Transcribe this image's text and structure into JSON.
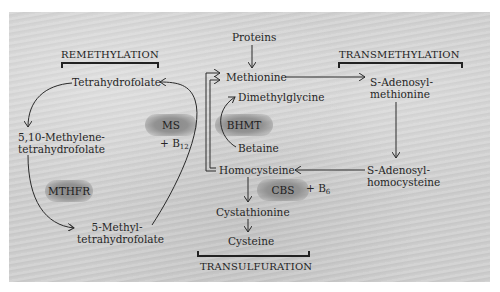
{
  "sections": {
    "remethylation": "REMETHYLATION",
    "transmethylation": "TRANSMETHYLATION",
    "transulfuration": "TRANSULFURATION"
  },
  "metabolites": {
    "proteins": "Proteins",
    "methionine": "Methionine",
    "dimethylglycine": "Dimethylglycine",
    "betaine": "Betaine",
    "homocysteine": "Homocysteine",
    "cystathionine": "Cystathionine",
    "cysteine": "Cysteine",
    "tetrahydrofolate": "Tetrahydrofolate",
    "methylene_thf_line1": "5,10-Methylene-",
    "methylene_thf_line2": "tetrahydrofolate",
    "methyl_thf_line1": "5-Methyl-",
    "methyl_thf_line2": "tetrahydrofolate",
    "sam_line1": "S-Adenosyl-",
    "sam_line2": "methionine",
    "sah_line1": "S-Adenosyl-",
    "sah_line2": "homocysteine"
  },
  "enzymes": {
    "ms": "MS",
    "bhmt": "BHMT",
    "mthfr": "MTHFR",
    "cbs": "CBS"
  },
  "cofactors": {
    "ms": {
      "prefix": "+ B",
      "sub": "12"
    },
    "cbs": {
      "prefix": "+ B",
      "sub": "6"
    }
  },
  "colors": {
    "background": "#cfcfcf",
    "enzyme_blob": "#8a8a8a",
    "line": "#2a2a2a"
  }
}
